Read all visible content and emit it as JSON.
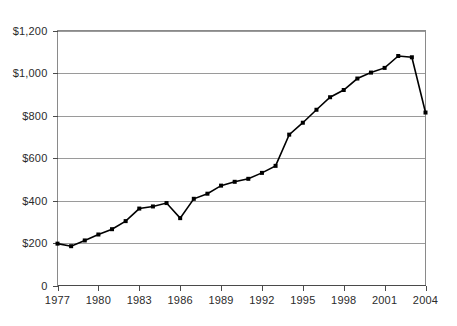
{
  "chart_data": {
    "type": "line",
    "title": "",
    "subtitle": "",
    "xlabel": "",
    "ylabel": "",
    "xlim": [
      1977,
      2004
    ],
    "ylim": [
      0,
      1200
    ],
    "grid": true,
    "legend": null,
    "legend_position": "none",
    "series_color": "#000000",
    "marker": "square",
    "x": [
      1977,
      1978,
      1979,
      1980,
      1981,
      1982,
      1983,
      1984,
      1985,
      1986,
      1987,
      1988,
      1989,
      1990,
      1991,
      1992,
      1993,
      1994,
      1995,
      1996,
      1997,
      1998,
      1999,
      2000,
      2001,
      2002,
      2003,
      2004
    ],
    "series": [
      {
        "name": "Value",
        "values": [
          197,
          185,
          212,
          240,
          265,
          303,
          362,
          372,
          388,
          317,
          408,
          432,
          470,
          488,
          502,
          530,
          563,
          710,
          766,
          827,
          886,
          920,
          974,
          1002,
          1024,
          1080,
          1074,
          814
        ]
      }
    ],
    "x_tick_values": [
      1977,
      1980,
      1983,
      1986,
      1989,
      1992,
      1995,
      1998,
      2001,
      2004
    ],
    "x_tick_labels": [
      "1977",
      "1980",
      "1983",
      "1986",
      "1989",
      "1992",
      "1995",
      "1998",
      "2001",
      "2004"
    ],
    "y_tick_values": [
      0,
      200,
      400,
      600,
      800,
      1000,
      1200
    ],
    "y_tick_labels": [
      "0",
      "$200",
      "$400",
      "$600",
      "$800",
      "$1,000",
      "$1,200"
    ]
  },
  "axes": {
    "y_axis_name": "y-axis",
    "x_axis_name": "x-axis"
  }
}
